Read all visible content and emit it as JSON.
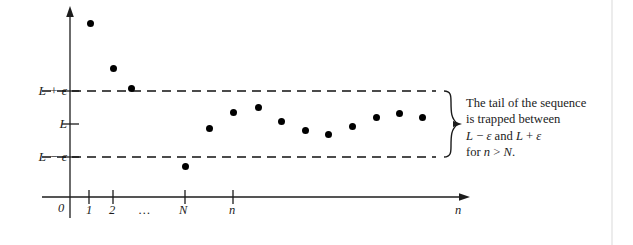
{
  "figure": {
    "y_axis": {
      "labels": [
        {
          "id": "upper",
          "text": "L + ε",
          "y": 91
        },
        {
          "id": "limit",
          "text": "L",
          "y": 124
        },
        {
          "id": "lower",
          "text": "L − ε",
          "y": 157
        }
      ]
    },
    "x_axis": {
      "label": "n",
      "ticks": [
        {
          "text": "0",
          "x": 62,
          "has_mark": false
        },
        {
          "text": "1",
          "x": 89,
          "has_mark": true
        },
        {
          "text": "2",
          "x": 113,
          "has_mark": true
        },
        {
          "text": "…",
          "x": 146,
          "has_mark": false
        },
        {
          "text": "N",
          "x": 185,
          "has_mark": true
        },
        {
          "text": "n",
          "x": 233,
          "has_mark": true
        }
      ]
    },
    "annotation": {
      "line1": "The tail of the sequence",
      "line2": "is trapped between",
      "line3_a": "L",
      "line3_b": "−",
      "line3_c": "ε",
      "line3_d": "and",
      "line3_e": "L",
      "line3_f": "+",
      "line3_g": "ε",
      "line4_a": "for",
      "line4_b": "n",
      "line4_c": ">",
      "line4_d": "N",
      "line4_e": "."
    },
    "colors": {
      "ink": "#1c1c1c",
      "dot": "#000000",
      "dashed": "#111111",
      "background": "#ffffff",
      "page_rule": "#e2e2e2"
    }
  },
  "chart_data": {
    "type": "scatter",
    "title": "",
    "xlabel": "n",
    "ylabel": "",
    "grid": false,
    "legend": null,
    "reference_lines": [
      {
        "label": "L + ε",
        "y_px": 91,
        "style": "dashed",
        "x_from": 42,
        "x_to": 436
      },
      {
        "label": "L",
        "y_px": 124,
        "style": "tick-only"
      },
      {
        "label": "L − ε",
        "y_px": 157,
        "style": "dashed",
        "x_from": 42,
        "x_to": 436
      }
    ],
    "points": [
      {
        "x": 90,
        "y": 23
      },
      {
        "x": 113,
        "y": 68
      },
      {
        "x": 131,
        "y": 88
      },
      {
        "x": 185,
        "y": 166
      },
      {
        "x": 209,
        "y": 128
      },
      {
        "x": 233,
        "y": 112
      },
      {
        "x": 258,
        "y": 107
      },
      {
        "x": 281,
        "y": 121
      },
      {
        "x": 305,
        "y": 130
      },
      {
        "x": 328,
        "y": 134
      },
      {
        "x": 352,
        "y": 126
      },
      {
        "x": 376,
        "y": 117
      },
      {
        "x": 399,
        "y": 113
      },
      {
        "x": 422,
        "y": 117
      }
    ]
  }
}
